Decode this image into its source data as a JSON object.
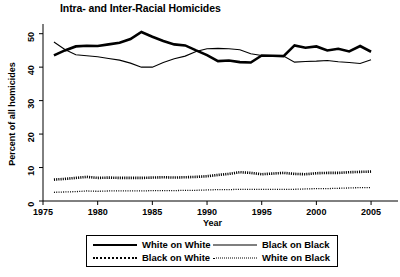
{
  "chart_data": {
    "type": "line",
    "title": "Intra- and Inter-Racial Homicides",
    "xlabel": "Year",
    "ylabel": "Percent of all homicides",
    "xlim": [
      1975,
      2006
    ],
    "ylim": [
      0,
      52
    ],
    "xticks": [
      1975,
      1980,
      1985,
      1990,
      1995,
      2000,
      2005
    ],
    "xticklabels": [
      "1975",
      "1980",
      "1985",
      "1990",
      "1995",
      "2000",
      "2005"
    ],
    "yticks": [
      0,
      10,
      20,
      30,
      40,
      50
    ],
    "yticklabels": [
      "0",
      "10",
      "20",
      "30",
      "40",
      "50"
    ],
    "grid": false,
    "legend_position": "below-axes",
    "x": [
      1976,
      1977,
      1978,
      1979,
      1980,
      1981,
      1982,
      1983,
      1984,
      1985,
      1986,
      1987,
      1988,
      1989,
      1990,
      1991,
      1992,
      1993,
      1994,
      1995,
      1996,
      1997,
      1998,
      1999,
      2000,
      2001,
      2002,
      2003,
      2004,
      2005
    ],
    "series": [
      {
        "name": "White on White",
        "style": "thick-solid",
        "color": "#000000",
        "values": [
          43.5,
          45.0,
          46.2,
          46.4,
          46.3,
          46.8,
          47.3,
          48.4,
          50.5,
          49.1,
          47.8,
          46.8,
          46.5,
          45.0,
          43.6,
          41.8,
          42.0,
          41.5,
          41.4,
          43.5,
          43.4,
          43.3,
          46.5,
          45.8,
          46.2,
          45.0,
          45.5,
          44.7,
          46.3,
          44.6
        ]
      },
      {
        "name": "Black on Black",
        "style": "thin-solid",
        "color": "#000000",
        "values": [
          47.5,
          45.3,
          43.7,
          43.4,
          43.1,
          42.6,
          42.1,
          41.2,
          40.0,
          40.0,
          41.4,
          42.5,
          43.3,
          44.7,
          45.5,
          45.6,
          45.5,
          45.2,
          44.0,
          43.5,
          43.4,
          43.3,
          41.5,
          41.7,
          41.8,
          42.0,
          41.6,
          41.4,
          41.1,
          42.2
        ]
      },
      {
        "name": "Black on White",
        "style": "thick-dotted",
        "color": "#000000",
        "values": [
          6.4,
          6.6,
          6.9,
          7.2,
          6.9,
          7.0,
          6.9,
          6.9,
          6.9,
          7.0,
          7.1,
          7.0,
          7.1,
          7.2,
          7.4,
          7.8,
          8.1,
          8.6,
          8.4,
          8.0,
          8.2,
          8.4,
          8.1,
          8.0,
          8.3,
          8.4,
          8.4,
          8.6,
          8.7,
          8.8
        ]
      },
      {
        "name": "White on Black",
        "style": "thin-dotted",
        "color": "#000000",
        "values": [
          2.6,
          2.7,
          2.8,
          3.0,
          2.9,
          3.0,
          3.0,
          3.0,
          3.0,
          3.1,
          3.1,
          3.1,
          3.2,
          3.2,
          3.3,
          3.4,
          3.4,
          3.5,
          3.5,
          3.5,
          3.5,
          3.5,
          3.5,
          3.6,
          3.7,
          3.7,
          3.8,
          3.9,
          4.0,
          4.0
        ]
      }
    ]
  },
  "legend": {
    "entries": [
      {
        "label": "White on White",
        "style": "thick-solid"
      },
      {
        "label": "Black on Black",
        "style": "thin-solid"
      },
      {
        "label": "Black on White",
        "style": "thick-dotted"
      },
      {
        "label": "White on Black",
        "style": "thin-dotted"
      }
    ]
  }
}
